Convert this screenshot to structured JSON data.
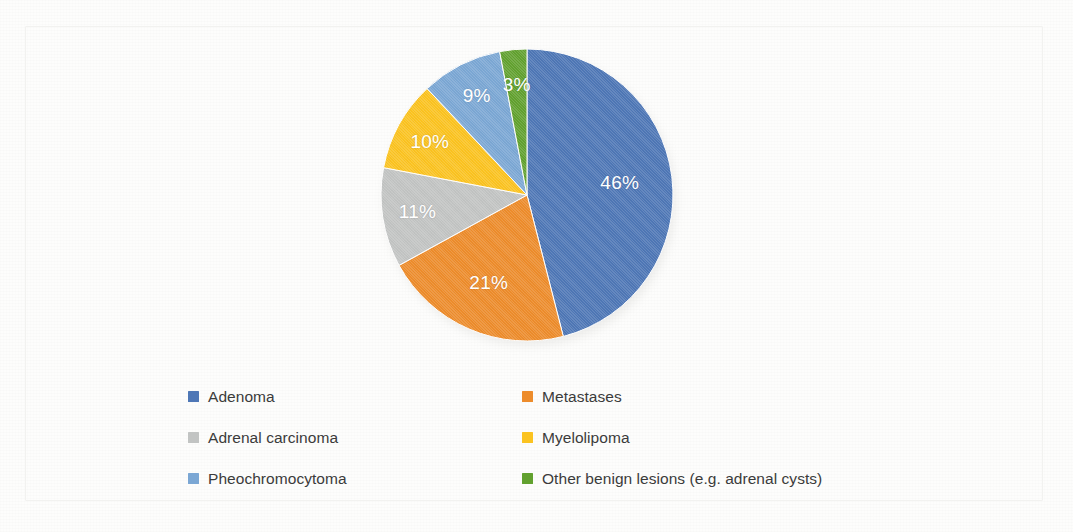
{
  "chart_data": {
    "type": "pie",
    "title": "",
    "subtitle": "",
    "xlabel": "",
    "ylabel": "",
    "grid": false,
    "legend_position": "bottom",
    "start_angle_deg": 0,
    "direction": "clockwise",
    "categories": [
      "Adenoma",
      "Metastases",
      "Adrenal carcinoma",
      "Myelolipoma",
      "Pheochromocytoma",
      "Other benign lesions (e.g. adrenal cysts)"
    ],
    "values": [
      46,
      21,
      11,
      10,
      9,
      3
    ],
    "value_unit": "%",
    "data_labels": [
      "46%",
      "21%",
      "11%",
      "10%",
      "9%",
      "3%"
    ],
    "colors": [
      "#4e77b6",
      "#ed8c2b",
      "#c2c4c3",
      "#fbc320",
      "#7ba7d4",
      "#62a12f"
    ],
    "slices": [
      {
        "label": "Adenoma",
        "value": 46,
        "data_label": "46%",
        "color": "#4e77b6"
      },
      {
        "label": "Metastases",
        "value": 21,
        "data_label": "21%",
        "color": "#ed8c2b"
      },
      {
        "label": "Adrenal carcinoma",
        "value": 11,
        "data_label": "11%",
        "color": "#c2c4c3"
      },
      {
        "label": "Myelolipoma",
        "value": 10,
        "data_label": "10%",
        "color": "#fbc320"
      },
      {
        "label": "Pheochromocytoma",
        "value": 9,
        "data_label": "9%",
        "color": "#7ba7d4"
      },
      {
        "label": "Other benign lesions (e.g. adrenal cysts)",
        "value": 3,
        "data_label": "3%",
        "color": "#62a12f"
      }
    ]
  },
  "legend": {
    "items": [
      {
        "label": "Adenoma",
        "color": "#4e77b6"
      },
      {
        "label": "Metastases",
        "color": "#ed8c2b"
      },
      {
        "label": "Adrenal carcinoma",
        "color": "#c2c4c3"
      },
      {
        "label": "Myelolipoma",
        "color": "#fbc320"
      },
      {
        "label": "Pheochromocytoma",
        "color": "#7ba7d4"
      },
      {
        "label": "Other benign lesions (e.g. adrenal cysts)",
        "color": "#62a12f"
      }
    ]
  },
  "style": {
    "label_text_color": "#ffffff",
    "legend_text_color": "#3b3b3b",
    "background_color": "#fdfdfc"
  }
}
